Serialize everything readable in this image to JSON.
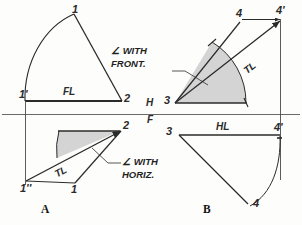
{
  "figure": {
    "reference_line": {
      "upper_label": "H",
      "lower_label": "F"
    },
    "colors": {
      "line": "#2b2b2b",
      "shade": "#cfcfcf",
      "reference": "#555555",
      "paper": "#fdfdfb"
    }
  },
  "quadrants": {
    "top_left": {
      "points": [
        {
          "key": "1",
          "label": "1"
        },
        {
          "key": "1prime",
          "label": "1'"
        },
        {
          "key": "2",
          "label": "2"
        }
      ],
      "line_labels": [
        {
          "key": "fl",
          "label": "FL"
        }
      ]
    },
    "top_right": {
      "points": [
        {
          "key": "4",
          "label": "4"
        },
        {
          "key": "4prime",
          "label": "4'"
        },
        {
          "key": "3",
          "label": "3"
        }
      ],
      "line_labels": [
        {
          "key": "tl",
          "label": "TL"
        }
      ],
      "annotation": {
        "line1": "∠ WITH",
        "line2": "FRONT."
      }
    },
    "bottom_left": {
      "points": [
        {
          "key": "2",
          "label": "2"
        },
        {
          "key": "1dprime",
          "label": "1''"
        },
        {
          "key": "1",
          "label": "1"
        }
      ],
      "line_labels": [
        {
          "key": "tl",
          "label": "TL"
        }
      ],
      "annotation": {
        "line1": "∠ WITH",
        "line2": "HORIZ."
      }
    },
    "bottom_right": {
      "points": [
        {
          "key": "3",
          "label": "3"
        },
        {
          "key": "4prime",
          "label": "4'"
        },
        {
          "key": "4",
          "label": "4"
        }
      ],
      "line_labels": [
        {
          "key": "hl",
          "label": "HL"
        }
      ]
    }
  },
  "figure_labels": [
    {
      "key": "a",
      "label": "A"
    },
    {
      "key": "b",
      "label": "B"
    }
  ]
}
